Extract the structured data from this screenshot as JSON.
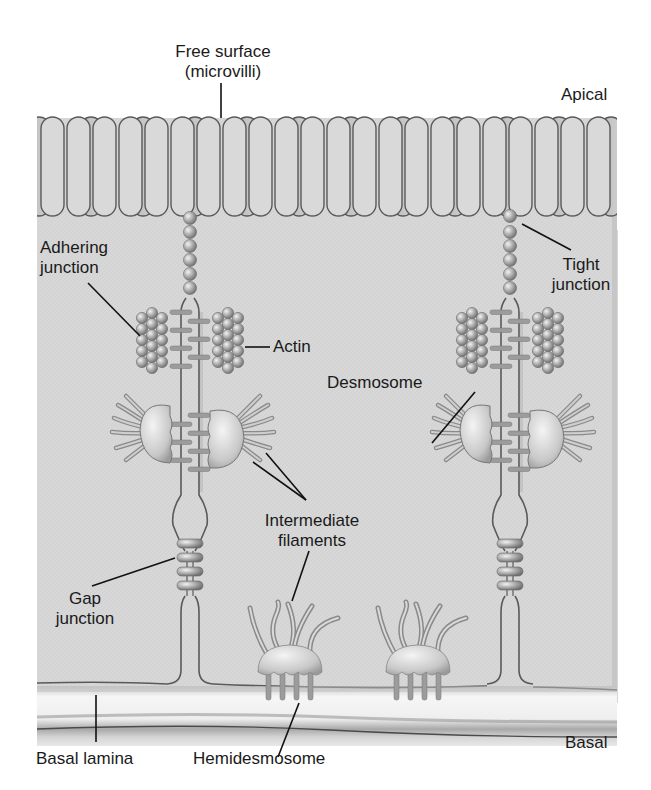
{
  "diagram": {
    "type": "epithelial-cell-junctions",
    "colors": {
      "background": "#ffffff",
      "cytoplasm": "#d6d6d6",
      "membrane": "#5a5a5a",
      "villus_front": "#dcdcdc",
      "villus_back": "#bdbdbd",
      "bead": "#a8a8a8",
      "plaque": "#d2d2d2",
      "filament": "#9a9a9a",
      "lamina_light": "#f0f0f0",
      "lamina_dark": "#a9a9a9",
      "leader": "#111111",
      "text": "#1a1a1a"
    },
    "regions": {
      "top": "Apical",
      "bottom": "Basal"
    },
    "labels": {
      "free_surface_line1": "Free surface",
      "free_surface_line2": "(microvilli)",
      "apical": "Apical",
      "adhering_line1": "Adhering",
      "adhering_line2": "junction",
      "tight_line1": "Tight",
      "tight_line2": "junction",
      "actin": "Actin",
      "desmosome": "Desmosome",
      "intermediate_line1": "Intermediate",
      "intermediate_line2": "filaments",
      "gap_line1": "Gap",
      "gap_line2": "junction",
      "basal_lamina": "Basal lamina",
      "hemidesmosome": "Hemidesmosome",
      "basal": "Basal"
    },
    "structures": [
      {
        "name": "Microvilli",
        "location": "apical free surface"
      },
      {
        "name": "Tight junction",
        "count": 2
      },
      {
        "name": "Adhering junction",
        "count": 2
      },
      {
        "name": "Actin",
        "count": 4
      },
      {
        "name": "Desmosome",
        "count": 2
      },
      {
        "name": "Intermediate filaments"
      },
      {
        "name": "Gap junction",
        "count": 2
      },
      {
        "name": "Hemidesmosome",
        "count": 2
      },
      {
        "name": "Basal lamina",
        "location": "basal"
      }
    ]
  }
}
